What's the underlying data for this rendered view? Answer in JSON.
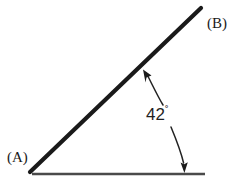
{
  "figure": {
    "type": "geometry-angle-diagram",
    "background_color": "#ffffff",
    "stroke_color": "#1a1a1a",
    "baseline_color": "#4a4a4a",
    "leader_color": "#222222"
  },
  "labels": {
    "point_a": "(A)",
    "point_b": "(B)",
    "angle_value": "42",
    "angle_unit": "˚"
  },
  "geometry": {
    "ray_ab": {
      "x1": 30,
      "y1": 172,
      "x2": 201,
      "y2": 8,
      "width": 4.2
    },
    "baseline": {
      "x1": 32,
      "y1": 174,
      "x2": 205,
      "y2": 174,
      "width": 2.6
    },
    "leader_upper": {
      "from_x": 162,
      "from_y": 104,
      "to_x": 144,
      "to_y": 71
    },
    "leader_lower": {
      "from_x": 172,
      "from_y": 127,
      "to_x": 184,
      "to_y": 170
    }
  }
}
